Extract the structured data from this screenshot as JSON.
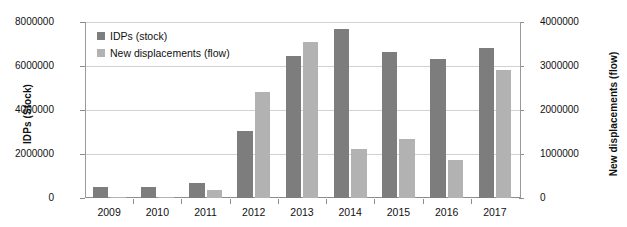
{
  "chart_data": {
    "type": "bar",
    "title": "",
    "subtitle": "",
    "xlabel": "",
    "ylabel": "IDPs (Stock)",
    "y2label": "New displacements (flow)",
    "categories": [
      "2009",
      "2010",
      "2011",
      "2012",
      "2013",
      "2014",
      "2015",
      "2016",
      "2017"
    ],
    "series": [
      {
        "name": "IDPs (stock)",
        "axis": "left",
        "color": "#7d7d7d",
        "values": [
          500000,
          480000,
          660000,
          3050000,
          6460000,
          7680000,
          6650000,
          6320000,
          6810000
        ]
      },
      {
        "name": "New displacements (flow)",
        "axis": "right",
        "color": "#b2b2b2",
        "values": [
          20000,
          15000,
          180000,
          2400000,
          3540000,
          1120000,
          1330000,
          870000,
          2910000
        ]
      }
    ],
    "ylim": [
      0,
      8000000
    ],
    "y2lim": [
      0,
      4000000
    ],
    "yticks": [
      "0",
      "2000000",
      "4000000",
      "6000000",
      "8000000"
    ],
    "y2ticks": [
      "0",
      "1000000",
      "2000000",
      "3000000",
      "4000000"
    ],
    "grid": true,
    "legend_position": "top-left"
  },
  "legend": {
    "items": [
      {
        "label": "IDPs (stock)",
        "swatch": "stock"
      },
      {
        "label": "New displacements (flow)",
        "swatch": "flow"
      }
    ]
  }
}
